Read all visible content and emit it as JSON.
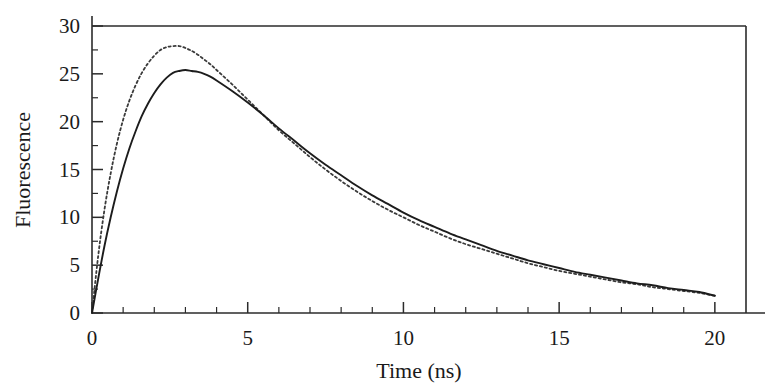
{
  "chart_data": {
    "type": "line",
    "title": "",
    "xlabel": "Time (ns)",
    "ylabel": "Fluorescence",
    "xlim": [
      0,
      21
    ],
    "ylim": [
      0,
      30
    ],
    "grid": false,
    "legend": "none",
    "x_major_ticks": [
      0,
      5,
      10,
      15,
      20
    ],
    "x_major_tick_labels": [
      "0",
      "5",
      "10",
      "15",
      "20"
    ],
    "x_minor_tick_step": 1,
    "y_major_ticks": [
      0,
      5,
      10,
      15,
      20,
      25,
      30
    ],
    "y_major_tick_labels": [
      "0",
      "5",
      "10",
      "15",
      "20",
      "25",
      "30"
    ],
    "y_minor_tick_step": 2.5,
    "x": [
      0,
      0.2,
      0.4,
      0.6,
      0.8,
      1.0,
      1.2,
      1.4,
      1.6,
      1.8,
      2.0,
      2.2,
      2.4,
      2.6,
      2.8,
      3.0,
      3.2,
      3.4,
      3.6,
      3.8,
      4.0,
      4.5,
      5.0,
      5.5,
      6.0,
      6.5,
      7.0,
      7.5,
      8.0,
      8.5,
      9.0,
      9.5,
      10.0,
      10.5,
      11.0,
      11.5,
      12.0,
      12.5,
      13.0,
      13.5,
      14.0,
      14.5,
      15.0,
      15.5,
      16.0,
      16.5,
      17.0,
      17.5,
      18.0,
      18.5,
      19.0,
      19.5,
      20.0
    ],
    "series": [
      {
        "name": "solid-curve",
        "style": "solid",
        "color": "#1c1c1c",
        "peak_value": 25.4,
        "peak_time": 2.85,
        "end_value": 1.8,
        "values": [
          0.0,
          3.6,
          7.0,
          10.0,
          12.7,
          15.1,
          17.2,
          19.0,
          20.6,
          21.9,
          23.0,
          23.9,
          24.6,
          25.1,
          25.3,
          25.4,
          25.3,
          25.2,
          25.0,
          24.7,
          24.3,
          23.2,
          22.0,
          20.7,
          19.3,
          18.0,
          16.7,
          15.5,
          14.4,
          13.3,
          12.3,
          11.4,
          10.5,
          9.7,
          9.0,
          8.3,
          7.7,
          7.1,
          6.5,
          6.0,
          5.5,
          5.1,
          4.7,
          4.3,
          4.0,
          3.7,
          3.4,
          3.1,
          2.9,
          2.6,
          2.4,
          2.2,
          1.8
        ]
      },
      {
        "name": "dotted-curve",
        "style": "dotted",
        "color": "#3a3a3a",
        "peak_value": 28.0,
        "peak_time": 2.2,
        "end_value": 1.8,
        "values": [
          0.0,
          6.0,
          10.8,
          14.6,
          17.7,
          20.2,
          22.2,
          23.8,
          25.1,
          26.1,
          26.9,
          27.5,
          27.8,
          27.9,
          27.9,
          27.7,
          27.4,
          27.0,
          26.5,
          26.0,
          25.4,
          23.9,
          22.3,
          20.7,
          19.1,
          17.7,
          16.3,
          15.0,
          13.8,
          12.7,
          11.7,
          10.8,
          10.0,
          9.2,
          8.5,
          7.8,
          7.2,
          6.7,
          6.2,
          5.7,
          5.2,
          4.8,
          4.4,
          4.1,
          3.8,
          3.5,
          3.2,
          3.0,
          2.7,
          2.5,
          2.3,
          2.1,
          1.8
        ]
      }
    ]
  }
}
